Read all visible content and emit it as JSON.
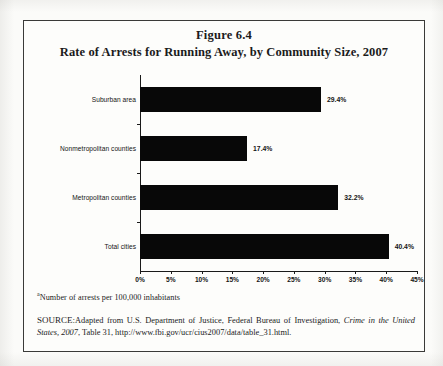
{
  "figure": {
    "number": "Figure 6.4",
    "title": "Rate of Arrests for Running Away, by Community Size, 2007",
    "footnote_marker": "a",
    "footnote": "Number of arrests per 100,000 inhabitants",
    "source_label": "SOURCE:",
    "source_text_1": "Adapted from U.S. Department of Justice, Federal Bureau of Investigation, ",
    "source_italic_1": "Crime in the United States, 2007",
    "source_text_2": ", Table 31, http://www.fbi.gov/ucr/cius2007/data/table_31.html."
  },
  "chart_data": {
    "type": "bar",
    "orientation": "horizontal",
    "title": "Rate of Arrests for Running Away, by Community Size, 2007",
    "xlabel": "",
    "ylabel": "",
    "categories": [
      "Suburban area",
      "Nonmetropolitan counties",
      "Metropolitan counties",
      "Total cities"
    ],
    "values": [
      29.4,
      17.4,
      32.2,
      40.4
    ],
    "value_labels": [
      "29.4%",
      "17.4%",
      "32.2%",
      "40.4%"
    ],
    "xlim": [
      0,
      45
    ],
    "xticks": [
      0,
      5,
      10,
      15,
      20,
      25,
      30,
      35,
      40,
      45
    ],
    "xtick_labels": [
      "0%",
      "5%",
      "10%",
      "15%",
      "20%",
      "25%",
      "30%",
      "35%",
      "40%",
      "45%"
    ],
    "grid": false,
    "legend": false,
    "bar_color": "#080808",
    "axis_color": "#1a1a1a"
  }
}
